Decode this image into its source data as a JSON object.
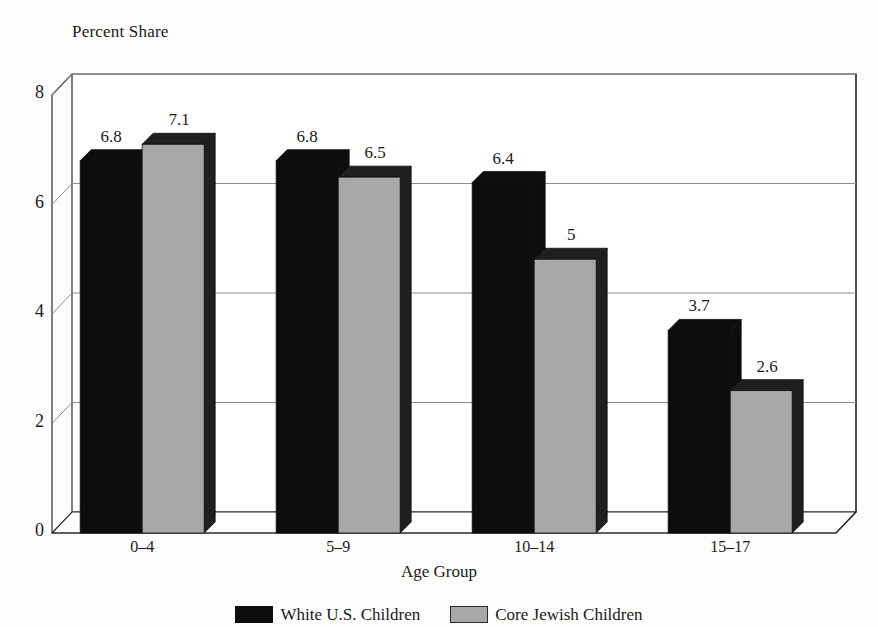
{
  "chart_data": {
    "type": "bar",
    "title": "",
    "ylabel": "Percent Share",
    "xlabel": "Age Group",
    "categories": [
      "0–4",
      "5–9",
      "10–14",
      "15–17"
    ],
    "ylim": [
      0,
      8
    ],
    "yticks": [
      "0",
      "2",
      "4",
      "6",
      "8"
    ],
    "grid": true,
    "legend_position": "bottom",
    "style": "3d-clustered-bar",
    "series": [
      {
        "name": "White U.S. Children",
        "color": "#0d0d0d",
        "values": [
          6.8,
          6.8,
          6.4,
          3.7
        ],
        "labels": [
          "6.8",
          "6.8",
          "6.4",
          "3.7"
        ]
      },
      {
        "name": "Core Jewish Children",
        "color": "#a8a8a8",
        "values": [
          7.1,
          6.5,
          5,
          2.6
        ],
        "labels": [
          "7.1",
          "6.5",
          "5",
          "2.6"
        ]
      }
    ]
  },
  "legend": {
    "items": [
      {
        "label": "White U.S. Children",
        "swatch": "black-swatch"
      },
      {
        "label": "Core Jewish Children",
        "swatch": "gray-swatch"
      }
    ]
  },
  "colors": {
    "background": "#fdfdfb",
    "bar_black": "#0d0d0d",
    "bar_gray": "#a8a8a8",
    "bar_gray_shade": "#1f1f1f",
    "axis": "#2b2b2b",
    "gridline": "#8e8e8e"
  }
}
